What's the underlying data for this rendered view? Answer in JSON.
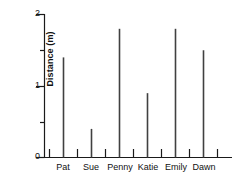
{
  "chart_data": {
    "type": "bar",
    "title": "",
    "subtitle": "",
    "xlabel": "",
    "ylabel": "Distance (m)",
    "categories": [
      "Pat",
      "Sue",
      "Penny",
      "Katie",
      "Emily",
      "Dawn"
    ],
    "values": [
      1.4,
      0.4,
      1.8,
      0.9,
      1.8,
      1.5
    ],
    "series": [
      {
        "name": "Distance",
        "values": [
          1.4,
          0.4,
          1.8,
          0.9,
          1.8,
          1.5
        ]
      }
    ],
    "ylim": [
      0,
      2
    ],
    "xlim": [
      0,
      6
    ],
    "ytick_labels": [
      "0",
      "1",
      "2"
    ],
    "ytick_values": [
      0,
      1,
      2
    ],
    "yminor_tick_values": [
      0.5,
      1.5
    ],
    "grid": false,
    "legend": false,
    "legend_position": "none",
    "annotations": [],
    "bar_style": "thin-line",
    "bar_color": "#404040",
    "axis_color": "#1a1a1a"
  },
  "axes": {
    "y_axis_title": "Distance (m)",
    "y_tick_0": "0",
    "y_tick_1": "1",
    "y_tick_2": "2",
    "x_label_0": "Pat",
    "x_label_1": "Sue",
    "x_label_2": "Penny",
    "x_label_3": "Katie",
    "x_label_4": "Emily",
    "x_label_5": "Dawn"
  }
}
